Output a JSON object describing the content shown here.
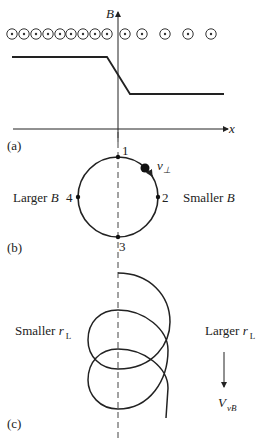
{
  "panel_a": {
    "label": "(a)",
    "y_axis_label": "B",
    "x_axis_label": "x",
    "field_symbols": {
      "icon": "out-of-page-dot-circle",
      "x_positions": [
        12,
        24,
        36,
        48,
        60,
        71,
        83,
        95,
        107,
        125,
        142,
        165,
        188,
        211
      ]
    },
    "profile": {
      "description": "Magnetic field magnitude: high on left, drops across gradient region near x=0, low on right",
      "high_level": "larger B",
      "low_level": "smaller B"
    }
  },
  "panel_b": {
    "label": "(b)",
    "points": [
      {
        "id": "1",
        "position": "top"
      },
      {
        "id": "2",
        "position": "right"
      },
      {
        "id": "3",
        "position": "bottom"
      },
      {
        "id": "4",
        "position": "left"
      }
    ],
    "velocity_label": "v",
    "velocity_subscript": "⊥",
    "left_label": "Larger B",
    "left_label_text": "Larger ",
    "left_label_var": "B",
    "right_label_text": "Smaller ",
    "right_label_var": "B"
  },
  "panel_c": {
    "label": "(c)",
    "left_label_text": "Smaller ",
    "left_label_var": "r",
    "left_label_sub": "L",
    "right_label_text": "Larger ",
    "right_label_var": "r",
    "right_label_sub": "L",
    "drift_label_var": "V",
    "drift_label_sub": "∇B",
    "drift_label_sub_display": "vB",
    "drift_direction": "down"
  }
}
